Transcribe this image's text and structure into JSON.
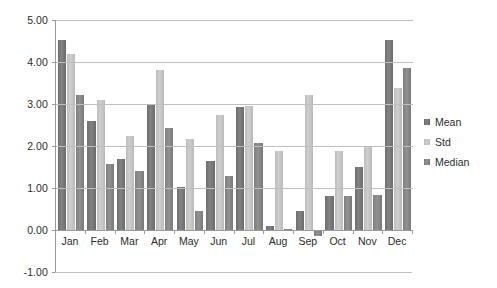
{
  "chart_data": {
    "type": "bar",
    "title": "",
    "xlabel": "",
    "ylabel": "",
    "categories": [
      "Jan",
      "Feb",
      "Mar",
      "Apr",
      "May",
      "Jun",
      "Jul",
      "Aug",
      "Sep",
      "Oct",
      "Nov",
      "Dec"
    ],
    "series": [
      {
        "name": "Mean",
        "color": "#7a7a7a",
        "values": [
          4.53,
          2.6,
          1.69,
          3.0,
          1.02,
          1.65,
          2.93,
          0.09,
          0.46,
          0.82,
          1.5,
          4.52
        ]
      },
      {
        "name": "Std",
        "color": "#c6c6c6",
        "values": [
          4.18,
          3.09,
          2.25,
          3.82,
          2.17,
          2.74,
          2.96,
          1.87,
          3.22,
          1.88,
          2.01,
          3.38
        ]
      },
      {
        "name": "Median",
        "color": "#8a8a8a",
        "values": [
          3.22,
          1.57,
          1.4,
          2.42,
          0.45,
          1.28,
          2.06,
          0.02,
          -0.15,
          0.82,
          0.83,
          3.86
        ]
      }
    ],
    "ylim": [
      -1.0,
      5.0
    ],
    "ytick_values": [
      5.0,
      4.0,
      3.0,
      2.0,
      1.0,
      0.0,
      -1.0
    ],
    "ytick_labels": [
      "5.00",
      "4.00",
      "3.00",
      "2.00",
      "1.00",
      "0.00",
      "-1.00"
    ],
    "grid": true,
    "grid_axis": "y",
    "legend_position": "right"
  },
  "legend": {
    "items": [
      {
        "label": "Mean"
      },
      {
        "label": "Std"
      },
      {
        "label": "Median"
      }
    ]
  }
}
